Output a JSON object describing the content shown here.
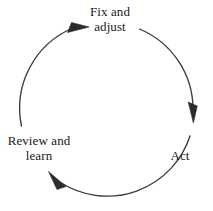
{
  "diagram": {
    "type": "cycle",
    "direction": "clockwise",
    "background_color": "#ffffff",
    "stroke_color": "#3a3a3a",
    "text_color": "#1a1a1a",
    "nodes": [
      {
        "id": "fix-adjust",
        "lines": [
          "Fix and",
          "adjust"
        ],
        "position": "top"
      },
      {
        "id": "act",
        "lines": [
          "Act"
        ],
        "position": "right"
      },
      {
        "id": "review-learn",
        "lines": [
          "Review and",
          "learn"
        ],
        "position": "bottom-left"
      }
    ],
    "arrows": [
      {
        "id": "fix-adjust-to-act",
        "from": "fix-adjust",
        "to": "act"
      },
      {
        "id": "act-to-review-learn",
        "from": "act",
        "to": "review-learn"
      },
      {
        "id": "review-learn-to-fix-adjust",
        "from": "review-learn",
        "to": "fix-adjust"
      }
    ]
  }
}
